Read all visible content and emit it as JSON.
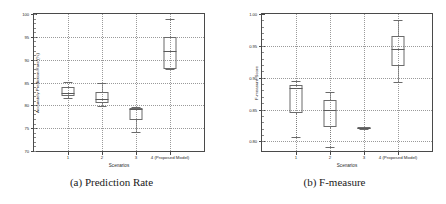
{
  "figure": {
    "background": "#ffffff",
    "line_color": "#6a6a6a",
    "grid_color": "#9a9a9a"
  },
  "subfigures": [
    {
      "caption": "(a) Prediction Rate",
      "chart_data": {
        "type": "box",
        "title": "",
        "xlabel": "Scenarios",
        "ylabel": "Accurately Prediction Rate (%)",
        "categories": [
          "1",
          "2",
          "3",
          "4 (Proposed Model)"
        ],
        "ylim": [
          70,
          100
        ],
        "yticks": [
          "70",
          "75",
          "80",
          "85",
          "90",
          "95",
          "100"
        ],
        "ytick_values": [
          70,
          75,
          80,
          85,
          90,
          95,
          100
        ],
        "grid": true,
        "legend": "none",
        "boxes": [
          {
            "category": "1",
            "whisker_low": 81.6,
            "q1": 82.0,
            "median": 82.8,
            "q3": 84.0,
            "whisker_high": 85.1
          },
          {
            "category": "2",
            "whisker_low": 79.9,
            "q1": 80.5,
            "median": 81.3,
            "q3": 83.0,
            "whisker_high": 85.0
          },
          {
            "category": "3",
            "whisker_low": 74.2,
            "q1": 76.8,
            "median": 79.2,
            "q3": 79.4,
            "whisker_high": 79.6
          },
          {
            "category": "4 (Proposed Model)",
            "whisker_low": 87.9,
            "q1": 88.0,
            "median": 92.0,
            "q3": 95.0,
            "whisker_high": 98.8
          }
        ]
      }
    },
    {
      "caption": "(b) F-measure",
      "chart_data": {
        "type": "box",
        "title": "",
        "xlabel": "Scenarios",
        "ylabel": "F-measure Score",
        "categories": [
          "1",
          "2",
          "3",
          "4 (Proposed Model)"
        ],
        "ylim": [
          0.785,
          1.0
        ],
        "yticks": [
          "0.80",
          "0.85",
          "0.90",
          "0.95",
          "1.00"
        ],
        "ytick_values": [
          0.8,
          0.85,
          0.9,
          0.95,
          1.0
        ],
        "grid": true,
        "legend": "none",
        "boxes": [
          {
            "category": "1",
            "whisker_low": 0.807,
            "q1": 0.845,
            "median": 0.884,
            "q3": 0.888,
            "whisker_high": 0.895
          },
          {
            "category": "2",
            "whisker_low": 0.791,
            "q1": 0.822,
            "median": 0.85,
            "q3": 0.865,
            "whisker_high": 0.878
          },
          {
            "category": "3",
            "whisker_low": 0.819,
            "q1": 0.82,
            "median": 0.821,
            "q3": 0.822,
            "whisker_high": 0.823
          },
          {
            "category": "4 (Proposed Model)",
            "whisker_low": 0.893,
            "q1": 0.918,
            "median": 0.945,
            "q3": 0.965,
            "whisker_high": 0.991
          }
        ]
      }
    }
  ]
}
